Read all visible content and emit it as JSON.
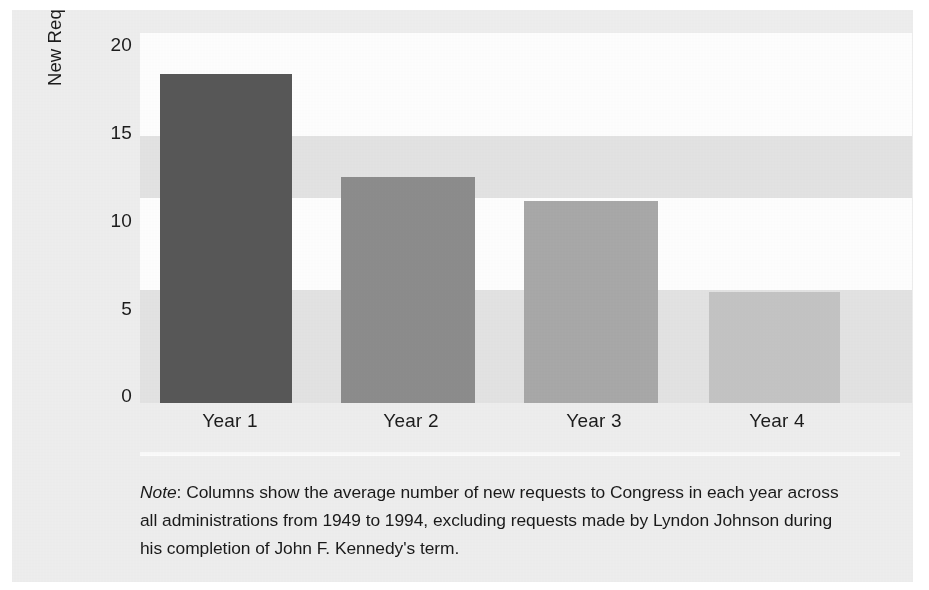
{
  "chart_data": {
    "type": "bar",
    "title": "",
    "subtitle": "",
    "xlabel": "",
    "ylabel": "New Requests to Congress",
    "categories": [
      "Year 1",
      "Year 2",
      "Year 3",
      "Year 4"
    ],
    "values": [
      17.8,
      12.2,
      10.9,
      6.0
    ],
    "ylim": [
      0,
      20
    ],
    "yticks": [
      0,
      5,
      10,
      15,
      20
    ],
    "ytick_labels": [
      "0",
      "5",
      "10",
      "15",
      "20"
    ],
    "grid": false,
    "banded_background": true,
    "legend": null,
    "bar_colors": [
      "#585858",
      "#8d8d8d",
      "#a9a9a9",
      "#c5c5c5"
    ],
    "annotations": []
  },
  "axes": {
    "y_label": "New Requests to Congress",
    "y_ticks": [
      {
        "label": "20",
        "value": 20
      },
      {
        "label": "15",
        "value": 15
      },
      {
        "label": "10",
        "value": 10
      },
      {
        "label": "5",
        "value": 5
      },
      {
        "label": "0",
        "value": 0
      }
    ],
    "x_ticks": [
      {
        "label": "Year 1"
      },
      {
        "label": "Year 2"
      },
      {
        "label": "Year 3"
      },
      {
        "label": "Year 4"
      }
    ]
  },
  "note": {
    "lead": "Note",
    "separator": ":",
    "text": " Columns show the average number of new requests to Congress in each year across all administrations from 1949 to 1994, excluding requests made by Lyndon Johnson during his completion of John F. Kennedy's term."
  },
  "colors": {
    "figure_background": "#efefef",
    "band_light": "#ffffff",
    "band_dark": "#e4e4e4",
    "text": "#1c1c1c"
  }
}
